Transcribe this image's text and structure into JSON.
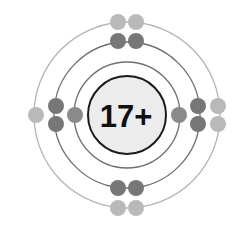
{
  "diagram": {
    "nucleus": {
      "label": "17+",
      "fill": "#ececec",
      "stroke": "#1a1a1a"
    },
    "center": {
      "x": 127,
      "y": 115
    },
    "shells": [
      {
        "name": "shell-1",
        "radius": 53,
        "stroke": "#6e6e6e",
        "electron_color": "#8a8a8a",
        "electron_count": 2
      },
      {
        "name": "shell-2",
        "radius": 73,
        "stroke": "#6e6e6e",
        "electron_color": "#777777",
        "electron_count": 8
      },
      {
        "name": "shell-3",
        "radius": 93,
        "stroke": "#b4b4b4",
        "electron_color": "#b9b9b9",
        "electron_count": 7
      }
    ],
    "electrons": [
      {
        "shell": 0,
        "x": 75,
        "y": 115
      },
      {
        "shell": 0,
        "x": 179,
        "y": 115
      },
      {
        "shell": 1,
        "x": 118,
        "y": 41
      },
      {
        "shell": 1,
        "x": 136,
        "y": 41
      },
      {
        "shell": 1,
        "x": 118,
        "y": 188
      },
      {
        "shell": 1,
        "x": 136,
        "y": 188
      },
      {
        "shell": 1,
        "x": 56,
        "y": 106
      },
      {
        "shell": 1,
        "x": 56,
        "y": 124
      },
      {
        "shell": 1,
        "x": 198,
        "y": 106
      },
      {
        "shell": 1,
        "x": 198,
        "y": 124
      },
      {
        "shell": 2,
        "x": 118,
        "y": 22
      },
      {
        "shell": 2,
        "x": 136,
        "y": 22
      },
      {
        "shell": 2,
        "x": 118,
        "y": 208
      },
      {
        "shell": 2,
        "x": 136,
        "y": 208
      },
      {
        "shell": 2,
        "x": 36,
        "y": 115
      },
      {
        "shell": 2,
        "x": 218,
        "y": 106
      },
      {
        "shell": 2,
        "x": 218,
        "y": 124
      }
    ],
    "electron_radius": 8
  }
}
